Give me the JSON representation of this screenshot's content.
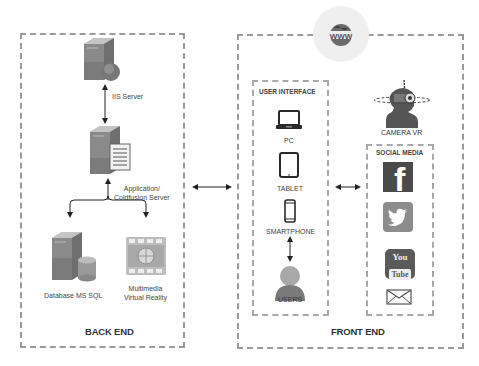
{
  "diagram": {
    "globe_icon": "www-globe-icon",
    "back_end": {
      "title": "BACK END",
      "nodes": [
        {
          "id": "iis",
          "label": "IIS Server",
          "icon": "server-globe-icon"
        },
        {
          "id": "app",
          "label_line1": "Application/",
          "label_line2": "Coldfusion Server",
          "icon": "server-document-icon"
        },
        {
          "id": "db",
          "label": "Database MS SQL",
          "icon": "server-database-icon"
        },
        {
          "id": "mm",
          "label_line1": "Multimedia",
          "label_line2": "Virtual Reality",
          "icon": "film-globe-icon"
        }
      ]
    },
    "front_end": {
      "title": "FRONT END",
      "user_interface": {
        "title": "USER INTERFACE",
        "devices": [
          {
            "label": "PC",
            "icon": "laptop-icon"
          },
          {
            "label": "TABLET",
            "icon": "tablet-icon"
          },
          {
            "label": "SMARTPHONE",
            "icon": "smartphone-icon"
          }
        ],
        "users": {
          "label": "USERS",
          "icon": "user-icon"
        }
      },
      "camera": {
        "label": "CAMERA VR",
        "icon": "vr-camera-head-icon"
      },
      "social_media": {
        "title": "SOCIAL MEDIA",
        "items": [
          {
            "name": "Facebook",
            "icon": "facebook-icon",
            "glyph": "f"
          },
          {
            "name": "Twitter",
            "icon": "twitter-icon"
          },
          {
            "name": "YouTube",
            "icon": "youtube-icon",
            "glyph_top": "You",
            "glyph_bottom": "Tube"
          },
          {
            "name": "Email",
            "icon": "email-icon"
          }
        ]
      }
    },
    "connectors": [
      {
        "from": "iis",
        "to": "app",
        "type": "bidirectional"
      },
      {
        "from": "app",
        "to": "db",
        "type": "directed"
      },
      {
        "from": "app",
        "to": "mm",
        "type": "directed"
      },
      {
        "from": "back_end",
        "to": "front_end",
        "type": "bidirectional"
      },
      {
        "from": "user_interface",
        "to": "social_media",
        "type": "bidirectional"
      },
      {
        "from": "smartphone",
        "to": "users",
        "type": "bidirectional"
      }
    ],
    "colors": {
      "dash": "#9a9a9a",
      "server_body": "#8a8a8a",
      "facebook": "#4a4a4a",
      "twitter": "#8c8c8c",
      "youtube": "#5a5a5a",
      "user": "#7a7a7a"
    }
  }
}
